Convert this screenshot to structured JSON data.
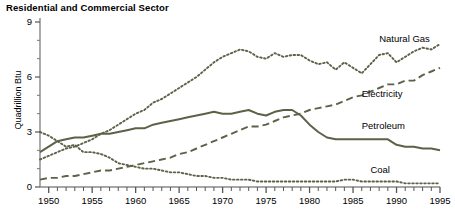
{
  "chart_data": {
    "type": "line",
    "title": "Residential and Commercial Sector",
    "xlabel": "",
    "ylabel": "Quadrillion Btu",
    "xlim": [
      1949,
      1995
    ],
    "ylim": [
      0,
      9
    ],
    "yticks": [
      0,
      3,
      6,
      9
    ],
    "xticks": [
      1950,
      1955,
      1960,
      1965,
      1970,
      1975,
      1980,
      1985,
      1990,
      1995
    ],
    "xtick_labels": [
      "1950",
      "1955",
      "1960",
      "1965",
      "1970",
      "1975",
      "1980",
      "1985",
      "1990",
      "1995"
    ],
    "ytick_labels": [
      "0",
      "3",
      "6",
      "9"
    ],
    "minor_xtick_interval": 1,
    "grid": false,
    "legend_position": "inline-labels",
    "line_color": "#5e6147",
    "x": [
      1949,
      1950,
      1951,
      1952,
      1953,
      1954,
      1955,
      1956,
      1957,
      1958,
      1959,
      1960,
      1961,
      1962,
      1963,
      1964,
      1965,
      1966,
      1967,
      1968,
      1969,
      1970,
      1971,
      1972,
      1973,
      1974,
      1975,
      1976,
      1977,
      1978,
      1979,
      1980,
      1981,
      1982,
      1983,
      1984,
      1985,
      1986,
      1987,
      1988,
      1989,
      1990,
      1991,
      1992,
      1993,
      1994,
      1995
    ],
    "series": [
      {
        "name": "Natural Gas",
        "style": "dotted",
        "label_x": 1988,
        "label_y": 8.1,
        "values": [
          1.5,
          1.7,
          1.9,
          2.1,
          2.2,
          2.4,
          2.6,
          2.9,
          3.1,
          3.4,
          3.7,
          4.0,
          4.2,
          4.6,
          4.8,
          5.1,
          5.4,
          5.7,
          6.0,
          6.4,
          6.8,
          7.1,
          7.3,
          7.5,
          7.4,
          7.1,
          7.0,
          7.3,
          7.1,
          7.2,
          7.2,
          6.9,
          6.7,
          6.8,
          6.4,
          6.8,
          6.5,
          6.2,
          6.7,
          7.2,
          7.3,
          6.8,
          7.1,
          7.4,
          7.6,
          7.5,
          7.8
        ]
      },
      {
        "name": "Electricity",
        "style": "dashed",
        "label_x": 1986,
        "label_y": 5.05,
        "values": [
          0.4,
          0.5,
          0.5,
          0.6,
          0.6,
          0.7,
          0.8,
          0.9,
          0.9,
          1.0,
          1.1,
          1.2,
          1.3,
          1.4,
          1.5,
          1.6,
          1.8,
          1.9,
          2.1,
          2.3,
          2.5,
          2.7,
          2.9,
          3.1,
          3.3,
          3.3,
          3.4,
          3.6,
          3.8,
          3.9,
          4.0,
          4.2,
          4.3,
          4.4,
          4.5,
          4.7,
          4.9,
          5.0,
          5.2,
          5.4,
          5.6,
          5.6,
          5.8,
          5.8,
          6.1,
          6.3,
          6.5
        ]
      },
      {
        "name": "Petroleum",
        "style": "solid",
        "label_x": 1986,
        "label_y": 3.35,
        "values": [
          1.9,
          2.2,
          2.5,
          2.6,
          2.7,
          2.7,
          2.8,
          2.9,
          2.9,
          3.0,
          3.1,
          3.2,
          3.2,
          3.4,
          3.5,
          3.6,
          3.7,
          3.8,
          3.9,
          4.0,
          4.1,
          4.0,
          4.0,
          4.1,
          4.2,
          4.0,
          3.9,
          4.1,
          4.2,
          4.2,
          3.9,
          3.4,
          3.0,
          2.7,
          2.6,
          2.6,
          2.6,
          2.6,
          2.6,
          2.6,
          2.6,
          2.3,
          2.2,
          2.2,
          2.1,
          2.1,
          2.0
        ]
      },
      {
        "name": "Coal",
        "style": "dotted",
        "label_x": 1987,
        "label_y": 0.95,
        "values": [
          3.0,
          2.8,
          2.5,
          2.2,
          2.3,
          1.9,
          1.9,
          1.8,
          1.6,
          1.3,
          1.2,
          1.1,
          1.0,
          1.0,
          0.9,
          0.8,
          0.8,
          0.7,
          0.6,
          0.6,
          0.5,
          0.5,
          0.4,
          0.4,
          0.4,
          0.3,
          0.3,
          0.3,
          0.3,
          0.3,
          0.3,
          0.3,
          0.3,
          0.3,
          0.3,
          0.4,
          0.4,
          0.3,
          0.3,
          0.3,
          0.3,
          0.3,
          0.2,
          0.2,
          0.2,
          0.2,
          0.2
        ]
      }
    ]
  }
}
